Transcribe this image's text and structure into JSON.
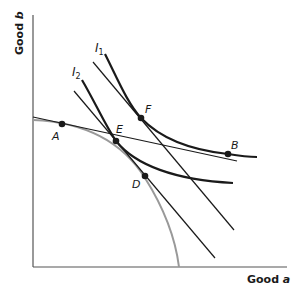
{
  "diagram": {
    "type": "trade-gains-indifference-diagram",
    "axes": {
      "x_label_prefix": "Good ",
      "x_label_var": "a",
      "y_label_prefix": "Good ",
      "y_label_var": "b"
    },
    "curves": {
      "ppf": {
        "name": "production-possibility-frontier",
        "color": "#999999"
      },
      "i1": {
        "label": "I",
        "sub": "1",
        "color": "#1a1a1a"
      },
      "i2": {
        "label": "I",
        "sub": "2",
        "color": "#1a1a1a"
      },
      "price_lines": [
        {
          "name": "price-line-AEB"
        },
        {
          "name": "price-line-F"
        },
        {
          "name": "price-line-ED"
        }
      ]
    },
    "points": [
      {
        "id": "A",
        "label": "A"
      },
      {
        "id": "E",
        "label": "E"
      },
      {
        "id": "F",
        "label": "F"
      },
      {
        "id": "B",
        "label": "B"
      },
      {
        "id": "D",
        "label": "D"
      }
    ],
    "colors": {
      "ink": "#1a1a1a",
      "ppf": "#999999",
      "axis": "#555555"
    }
  }
}
